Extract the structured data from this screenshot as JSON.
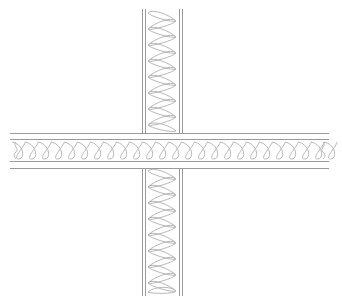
{
  "diagram": {
    "type": "wall-intersection-section",
    "colors": {
      "background": "#ffffff",
      "line": "#9a9a9a",
      "insulation": "#b8b8b8"
    },
    "vertical_wall": {
      "outer_left_x": 142,
      "inner_left_x": 145,
      "inner_right_x": 179,
      "outer_right_x": 182,
      "top_y": 9,
      "bottom_y": 296,
      "insulation_period": 16
    },
    "horizontal_wall": {
      "outer_top_y": 133,
      "inner_top_y": 139,
      "inner_bottom_y": 161,
      "outer_bottom_y": 168,
      "left_x": 10,
      "right_x": 329,
      "insulation_period": 13
    },
    "labels": []
  }
}
